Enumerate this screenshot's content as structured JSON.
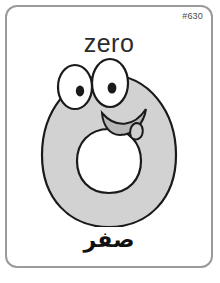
{
  "card": {
    "number_label": "#630",
    "word": "zero",
    "translation": "صفر",
    "translation_language": "Arabic",
    "border_color": "#9a9a9a",
    "background_color": "#ffffff"
  },
  "illustration": {
    "name": "cartoon-zero-character",
    "body_fill": "#d2d2d2",
    "body_outline": "#1a1a1a",
    "hole_fill": "#ffffff",
    "eye_fill": "#ffffff",
    "eye_outline": "#1a1a1a",
    "pupil_fill": "#1a1a1a",
    "mouth_outline": "#1a1a1a",
    "mouth_fill": "#b8b8b8"
  }
}
